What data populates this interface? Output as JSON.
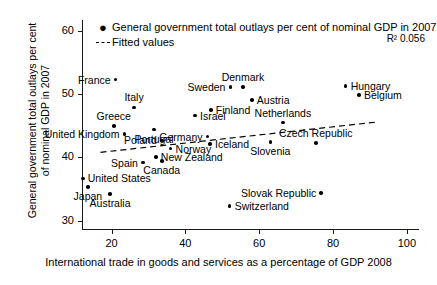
{
  "chart_data": {
    "type": "scatter",
    "title": "",
    "xlabel": "International trade in goods and services as a percentage of GDP 2008",
    "ylabel": "General government total outlays per cent\nof nominal GDP in 2007",
    "xlim": [
      12,
      103
    ],
    "ylim": [
      28.7,
      61.7
    ],
    "xticks": [
      20,
      40,
      60,
      80,
      100
    ],
    "yticks": [
      30,
      40,
      50,
      60
    ],
    "grid": false,
    "legend_position": "top-left",
    "annotation": "R² 0.056",
    "legend": [
      {
        "marker": "dot",
        "label": "General government total outlays per cent of nominal GDP in 2007"
      },
      {
        "marker": "dash",
        "label": "Fitted values"
      }
    ],
    "series": [
      {
        "name": "General government total outlays per cent of nominal GDP in 2007",
        "points": [
          {
            "label": "France",
            "x": 21.1,
            "y": 52.3,
            "label_pos": "left"
          },
          {
            "label": "Italy",
            "x": 26.1,
            "y": 47.9,
            "label_pos": "above"
          },
          {
            "label": "Greece",
            "x": 20.6,
            "y": 45.0,
            "label_pos": "above"
          },
          {
            "label": "United Kingdom",
            "x": 23.5,
            "y": 43.7,
            "label_pos": "left"
          },
          {
            "label": "Spain",
            "x": 28.5,
            "y": 39.2,
            "label_pos": "left"
          },
          {
            "label": "Canada",
            "x": 33.6,
            "y": 39.4,
            "label_pos": "below"
          },
          {
            "label": "New Zealand",
            "x": 32.0,
            "y": 40.1,
            "label_pos": "right"
          },
          {
            "label": "United States",
            "x": 12.2,
            "y": 36.7,
            "label_pos": "right"
          },
          {
            "label": "Japan",
            "x": 13.6,
            "y": 35.3,
            "label_pos": "below"
          },
          {
            "label": "Australia",
            "x": 19.6,
            "y": 34.2,
            "label_pos": "below"
          },
          {
            "label": "Portugal",
            "x": 31.5,
            "y": 44.4,
            "label_pos": "below"
          },
          {
            "label": "Poland",
            "x": 33.6,
            "y": 42.7,
            "label_pos": "left"
          },
          {
            "label": "Norway",
            "x": 36.0,
            "y": 41.4,
            "label_pos": "right"
          },
          {
            "label": "Israel",
            "x": 42.6,
            "y": 46.6,
            "label_pos": "right"
          },
          {
            "label": "Germany",
            "x": 46.0,
            "y": 43.3,
            "label_pos": "left"
          },
          {
            "label": "Iceland",
            "x": 46.7,
            "y": 42.1,
            "label_pos": "right"
          },
          {
            "label": "Finland",
            "x": 46.9,
            "y": 47.5,
            "label_pos": "right"
          },
          {
            "label": "Sweden",
            "x": 52.2,
            "y": 51.1,
            "label_pos": "left"
          },
          {
            "label": "Denmark",
            "x": 55.6,
            "y": 51.1,
            "label_pos": "above"
          },
          {
            "label": "Austria",
            "x": 58.0,
            "y": 49.1,
            "label_pos": "right"
          },
          {
            "label": "Switzerland",
            "x": 52.0,
            "y": 32.3,
            "label_pos": "right"
          },
          {
            "label": "Netherlands",
            "x": 66.4,
            "y": 45.5,
            "label_pos": "above"
          },
          {
            "label": "Slovenia",
            "x": 63.0,
            "y": 42.4,
            "label_pos": "below"
          },
          {
            "label": "Czech Republic",
            "x": 75.3,
            "y": 42.3,
            "label_pos": "above"
          },
          {
            "label": "Slovak Republic",
            "x": 76.8,
            "y": 34.4,
            "label_pos": "left"
          },
          {
            "label": "Hungary",
            "x": 83.4,
            "y": 51.3,
            "label_pos": "right"
          },
          {
            "label": "Belgium",
            "x": 87.0,
            "y": 49.9,
            "label_pos": "right"
          }
        ]
      }
    ],
    "fit_line": {
      "name": "Fitted values",
      "style": "dashed",
      "x_start": 17.0,
      "y_start": 40.8,
      "x_end": 92.0,
      "y_end": 45.6
    }
  }
}
